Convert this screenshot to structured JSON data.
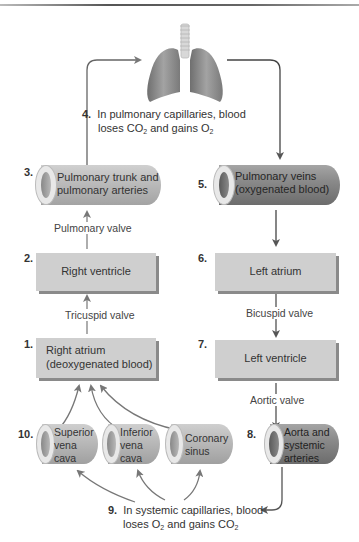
{
  "diagram": {
    "colors": {
      "box_fill": "#cfcfcf",
      "box_shadow": "#8a8a8a",
      "deoxygenated_vessel": "#b5b5b5",
      "oxygenated_vessel": "#7d7d7d",
      "arrow": "#555555",
      "lungs": "#8f8f8f"
    },
    "lungs": {
      "icon": "lungs-icon",
      "step_number": "4.",
      "caption_line1": "In pulmonary capillaries, blood",
      "caption_line2_pre": "loses CO",
      "caption_line2_sub1": "2",
      "caption_line2_mid": " and gains O",
      "caption_line2_sub2": "2"
    },
    "left_column": {
      "pulmonary_trunk": {
        "step": "3.",
        "line1": "Pulmonary trunk and",
        "line2": "pulmonary arteries"
      },
      "pulmonary_valve": "Pulmonary valve",
      "right_ventricle": {
        "step": "2.",
        "label": "Right ventricle"
      },
      "tricuspid_valve": "Tricuspid valve",
      "right_atrium": {
        "step": "1.",
        "line1": "Right atrium",
        "line2": "(deoxygenated blood)"
      }
    },
    "right_column": {
      "pulmonary_veins": {
        "step": "5.",
        "line1": "Pulmonary veins",
        "line2": "(oxygenated blood)"
      },
      "left_atrium": {
        "step": "6.",
        "label": "Left atrium"
      },
      "bicuspid_valve": "Bicuspid valve",
      "left_ventricle": {
        "step": "7.",
        "label": "Left ventricle"
      },
      "aortic_valve": "Aortic valve",
      "aorta": {
        "step": "8.",
        "line1": "Aorta and",
        "line2": "systemic",
        "line3": "arteries"
      }
    },
    "veins": {
      "step": "10.",
      "superior_vena_cava": {
        "line1": "Superior",
        "line2": "vena",
        "line3": "cava"
      },
      "inferior_vena_cava": {
        "line1": "Inferior",
        "line2": "vena",
        "line3": "cava"
      },
      "coronary_sinus": {
        "line1": "Coronary",
        "line2": "sinus"
      }
    },
    "systemic": {
      "step_number": "9.",
      "caption_line1": "In systemic capillaries, blood",
      "caption_line2_pre": "loses O",
      "caption_line2_sub1": "2",
      "caption_line2_mid": " and gains CO",
      "caption_line2_sub2": "2"
    }
  }
}
